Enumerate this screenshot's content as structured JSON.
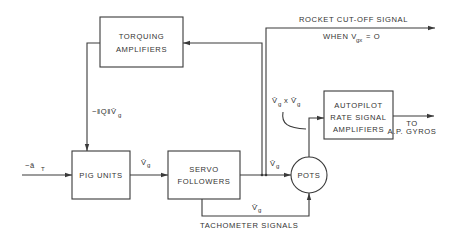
{
  "diagram": {
    "type": "block-diagram",
    "blocks": {
      "torquing": {
        "line1": "TORQUING",
        "line2": "AMPLIFIERS"
      },
      "pig": {
        "label": "PIG UNITS"
      },
      "servo": {
        "line1": "SERVO",
        "line2": "FOLLOWERS"
      },
      "pots": {
        "label": "POTS"
      },
      "autopilot": {
        "line1": "AUTOPILOT",
        "line2": "RATE SIGNAL",
        "line3": "AMPLIFIERS"
      }
    },
    "signals": {
      "input": "−ā",
      "input_sub": "T",
      "feedback": "−‖Q‖V̄",
      "feedback_sub": "g",
      "pig_out": "V̄",
      "pig_out_sub": "g",
      "servo_out": "V̄",
      "servo_out_sub": "g",
      "tach": "V̄̇",
      "tach_sub": "g",
      "tach_label": "TACHOMETER SIGNALS",
      "cross": "V̄",
      "cross_sub": "g",
      "cross_x": "x",
      "cross2": "V̄̇",
      "cross2_sub": "g",
      "cutoff": "ROCKET CUT-OFF SIGNAL",
      "cutoff_when": "WHEN V",
      "cutoff_sub": "gx",
      "cutoff_eq": "= O",
      "to_line1": "TO",
      "to_line2": "A.P. GYROS"
    }
  }
}
